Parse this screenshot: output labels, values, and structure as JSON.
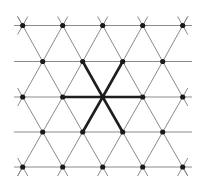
{
  "diagram": {
    "type": "triangular-lattice",
    "colors": {
      "background": "#ffffff",
      "lattice_line": "#8a8a8a",
      "highlight_bond": "#1e1e1e",
      "node": "#1a1a1a"
    },
    "geometry": {
      "spacing_x": 40,
      "row_ys": [
        25.5,
        61.5,
        97,
        132,
        167
      ],
      "even_row_xs": [
        22.7,
        62.7,
        102.7,
        142.7,
        182.7
      ],
      "odd_row_xs": [
        42.7,
        82.7,
        122.7,
        162.7
      ],
      "horizontal_line_x_range": [
        14,
        192
      ],
      "edge_overhang": 9
    },
    "center_node": {
      "x": 102.7,
      "y": 97
    },
    "highlighted_bonds": [
      {
        "to": [
          82.7,
          61.5
        ]
      },
      {
        "to": [
          122.7,
          61.5
        ]
      },
      {
        "to": [
          62.7,
          97
        ]
      },
      {
        "to": [
          142.7,
          97
        ]
      },
      {
        "to": [
          82.7,
          132
        ]
      },
      {
        "to": [
          122.7,
          132
        ]
      }
    ],
    "node_radius": 2.6
  }
}
